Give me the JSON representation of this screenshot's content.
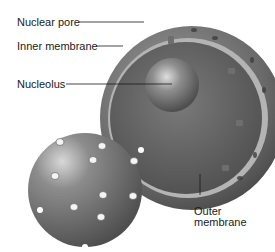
{
  "diagram": {
    "labels": {
      "nuclear_pore": "Nuclear pore",
      "inner_membrane": "Inner membrane",
      "nucleolus": "Nucleolus",
      "outer_membrane_line1": "Outer",
      "outer_membrane_line2": "membrane"
    },
    "colors": {
      "background": "#ffffff",
      "envelope_dark": "#5a5a5a",
      "envelope_light": "#8a8a8a",
      "inner_gap": "#b0b0b0",
      "nucleolus": "#7a7a7a",
      "leader_line": "#1a1a1a"
    }
  }
}
